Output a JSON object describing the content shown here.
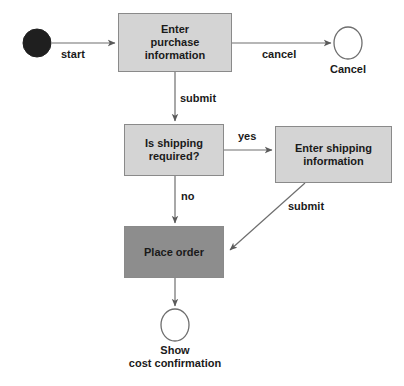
{
  "diagram": {
    "type": "uml-activity-diagram",
    "colors": {
      "activity_fill_light": "#d4d4d4",
      "activity_fill_dark": "#8d8d8d",
      "node_border": "#8a8a8a",
      "edge_stroke": "#6e6e6e",
      "start_node_fill": "#1f1f1f",
      "end_node_fill": "#ffffff",
      "text": "#1a1a1a",
      "background": "#ffffff"
    },
    "nodes": [
      {
        "id": "start",
        "kind": "initial-node",
        "shape": "filled-circle",
        "label": "",
        "cx": 37,
        "cy": 43,
        "r": 14
      },
      {
        "id": "enter-purchase-information",
        "kind": "activity",
        "shape": "rectangle",
        "fill": "light",
        "label": "Enter\npurchase\ninformation",
        "x": 118,
        "y": 13,
        "w": 114,
        "h": 59
      },
      {
        "id": "cancel-end",
        "kind": "final-node",
        "shape": "hollow-ellipse",
        "label": "Cancel",
        "cx": 348,
        "cy": 43,
        "rx": 14,
        "ry": 16
      },
      {
        "id": "is-shipping-required",
        "kind": "decision",
        "shape": "rectangle",
        "fill": "light",
        "label": "Is shipping\nrequired?",
        "x": 124,
        "y": 124,
        "w": 100,
        "h": 52
      },
      {
        "id": "enter-shipping-information",
        "kind": "activity",
        "shape": "rectangle",
        "fill": "light",
        "label": "Enter shipping\ninformation",
        "x": 275,
        "y": 126,
        "w": 117,
        "h": 57
      },
      {
        "id": "place-order",
        "kind": "activity",
        "shape": "rectangle",
        "fill": "dark",
        "label": "Place order",
        "x": 124,
        "y": 226,
        "w": 100,
        "h": 52
      },
      {
        "id": "show-cost-confirmation",
        "kind": "final-node",
        "shape": "hollow-ellipse",
        "label": "Show\ncost confirmation",
        "cx": 175,
        "cy": 325,
        "rx": 14,
        "ry": 16
      }
    ],
    "edges": [
      {
        "id": "start-to-enter-purchase",
        "label": "start",
        "from": "start",
        "to": "enter-purchase-information",
        "direction": "right"
      },
      {
        "id": "enter-purchase-to-cancel",
        "label": "cancel",
        "from": "enter-purchase-information",
        "to": "cancel-end",
        "direction": "right"
      },
      {
        "id": "enter-purchase-to-decision",
        "label": "submit",
        "from": "enter-purchase-information",
        "to": "is-shipping-required",
        "direction": "down"
      },
      {
        "id": "decision-to-shipping",
        "label": "yes",
        "from": "is-shipping-required",
        "to": "enter-shipping-information",
        "direction": "right"
      },
      {
        "id": "decision-to-place-order",
        "label": "no",
        "from": "is-shipping-required",
        "to": "place-order",
        "direction": "down"
      },
      {
        "id": "shipping-to-place-order",
        "label": "submit",
        "from": "enter-shipping-information",
        "to": "place-order",
        "direction": "diagonal-down-left"
      },
      {
        "id": "place-order-to-confirmation",
        "label": "",
        "from": "place-order",
        "to": "show-cost-confirmation",
        "direction": "down"
      }
    ],
    "edge_labels": {
      "start": "start",
      "cancel": "cancel",
      "submit_purchase": "submit",
      "yes": "yes",
      "no": "no",
      "submit_shipping": "submit"
    },
    "node_labels": {
      "enter_purchase_information": "Enter\npurchase\ninformation",
      "cancel_end": "Cancel",
      "is_shipping_required": "Is shipping\nrequired?",
      "enter_shipping_information": "Enter shipping\ninformation",
      "place_order": "Place order",
      "show_cost_confirmation": "Show\ncost confirmation"
    }
  }
}
